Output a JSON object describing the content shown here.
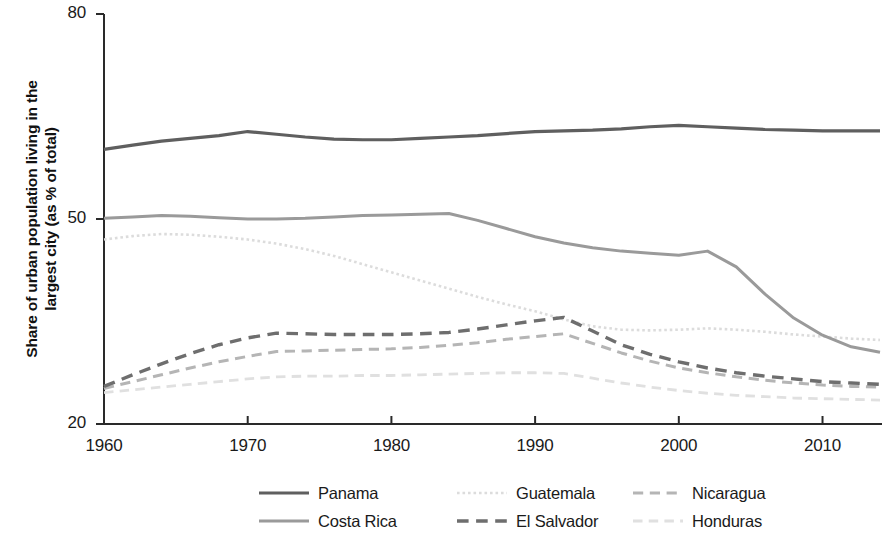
{
  "chart_data": {
    "type": "line",
    "title": "",
    "xlabel": "",
    "ylabel": "Share of urban population living in the\nlargest city (as % of total)",
    "xlim": [
      1960,
      2014
    ],
    "ylim": [
      20,
      80
    ],
    "ytick_labels": [
      "80",
      "50",
      "20"
    ],
    "ytick_values": [
      80,
      50,
      20
    ],
    "xtick_labels": [
      "1960",
      "1970",
      "1980",
      "1990",
      "2000",
      "2010"
    ],
    "xtick_values": [
      1960,
      1970,
      1980,
      1990,
      2000,
      2010
    ],
    "grid": false,
    "legend_position": "bottom",
    "x": [
      1960,
      1962,
      1964,
      1966,
      1968,
      1970,
      1972,
      1974,
      1976,
      1978,
      1980,
      1982,
      1984,
      1986,
      1988,
      1990,
      1992,
      1994,
      1996,
      1998,
      2000,
      2002,
      2004,
      2006,
      2008,
      2010,
      2012,
      2014
    ],
    "series": [
      {
        "name": "Panama",
        "color": "#5f5f5f",
        "style": "solid",
        "width": 3.2,
        "values": [
          60.2,
          60.8,
          61.4,
          61.8,
          62.2,
          62.8,
          62.4,
          62.0,
          61.7,
          61.6,
          61.6,
          61.8,
          62.0,
          62.2,
          62.5,
          62.8,
          62.9,
          63.0,
          63.2,
          63.5,
          63.7,
          63.5,
          63.3,
          63.1,
          63.0,
          62.9,
          62.9,
          62.9
        ]
      },
      {
        "name": "Costa Rica",
        "color": "#9a9a9a",
        "style": "solid",
        "width": 3.0,
        "values": [
          50.1,
          50.3,
          50.5,
          50.4,
          50.2,
          50.0,
          50.0,
          50.1,
          50.3,
          50.5,
          50.6,
          50.7,
          50.8,
          49.8,
          48.6,
          47.4,
          46.5,
          45.8,
          45.3,
          45.0,
          44.7,
          45.3,
          43.0,
          39.0,
          35.5,
          33.0,
          31.3,
          30.5
        ]
      },
      {
        "name": "Guatemala",
        "color": "#dcdcdc",
        "style": "dotted",
        "width": 2.6,
        "values": [
          47.0,
          47.5,
          47.8,
          47.7,
          47.4,
          47.0,
          46.4,
          45.6,
          44.6,
          43.4,
          42.2,
          41.0,
          39.8,
          38.6,
          37.5,
          36.5,
          35.3,
          34.3,
          33.8,
          33.7,
          33.8,
          34.0,
          33.8,
          33.5,
          33.1,
          32.8,
          32.5,
          32.3
        ]
      },
      {
        "name": "El Salvador",
        "color": "#6e6e6e",
        "style": "dashed",
        "width": 3.4,
        "values": [
          25.5,
          27.2,
          28.8,
          30.3,
          31.6,
          32.6,
          33.3,
          33.2,
          33.1,
          33.1,
          33.1,
          33.2,
          33.4,
          33.9,
          34.5,
          35.1,
          35.6,
          33.6,
          31.6,
          30.2,
          29.1,
          28.2,
          27.5,
          27.0,
          26.6,
          26.2,
          26.0,
          25.8
        ]
      },
      {
        "name": "Nicaragua",
        "color": "#b5b5b5",
        "style": "dashed",
        "width": 3.0,
        "values": [
          25.2,
          26.2,
          27.2,
          28.2,
          29.1,
          29.9,
          30.6,
          30.7,
          30.8,
          30.9,
          31.0,
          31.2,
          31.5,
          31.9,
          32.4,
          32.8,
          33.2,
          31.8,
          30.4,
          29.2,
          28.2,
          27.5,
          26.9,
          26.4,
          26.0,
          25.7,
          25.5,
          25.4
        ]
      },
      {
        "name": "Honduras",
        "color": "#e0e0e0",
        "style": "dashed",
        "width": 2.8,
        "values": [
          24.6,
          25.0,
          25.4,
          25.8,
          26.2,
          26.6,
          26.9,
          27.0,
          27.0,
          27.1,
          27.1,
          27.2,
          27.3,
          27.4,
          27.5,
          27.5,
          27.4,
          26.7,
          26.0,
          25.4,
          24.9,
          24.5,
          24.2,
          24.0,
          23.8,
          23.7,
          23.6,
          23.5
        ]
      }
    ]
  },
  "axis": {
    "color": "#2a2a2a"
  },
  "legend": {
    "items": [
      {
        "label": "Panama",
        "series": "Panama",
        "col": 0,
        "row": 0
      },
      {
        "label": "Costa Rica",
        "series": "Costa Rica",
        "col": 0,
        "row": 1
      },
      {
        "label": "Guatemala",
        "series": "Guatemala",
        "col": 1,
        "row": 0
      },
      {
        "label": "El Salvador",
        "series": "El Salvador",
        "col": 1,
        "row": 1
      },
      {
        "label": "Nicaragua",
        "series": "Nicaragua",
        "col": 2,
        "row": 0
      },
      {
        "label": "Honduras",
        "series": "Honduras",
        "col": 2,
        "row": 1
      }
    ]
  }
}
